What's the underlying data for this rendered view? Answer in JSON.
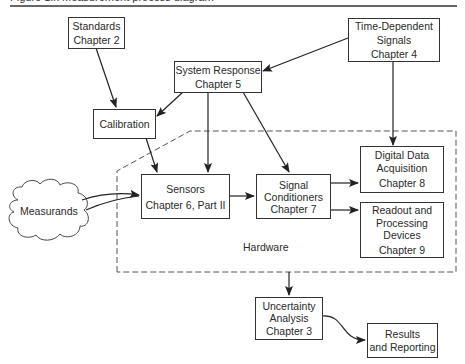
{
  "caption": "Figure 1.x  Measurement process diagram",
  "nodes": {
    "standards": {
      "line1": "Standards",
      "line2": "Chapter 2"
    },
    "time_dependent": {
      "line1": "Time-Dependent",
      "line2": "Signals",
      "line3": "Chapter 4"
    },
    "system_response": {
      "line1": "System Response",
      "line2": "Chapter 5"
    },
    "calibration": {
      "line1": "Calibration"
    },
    "measurands": {
      "line1": "Measurands"
    },
    "sensors": {
      "line1": "Sensors",
      "line2": "Chapter 6, Part II"
    },
    "signal_conditioners": {
      "line1": "Signal",
      "line2": "Conditioners",
      "line3": "Chapter 7"
    },
    "digital_data": {
      "line1": "Digital Data",
      "line2": "Acquisition",
      "line3": "Chapter 8"
    },
    "readout": {
      "line1": "Readout and",
      "line2": "Processing",
      "line3": "Devices",
      "line4": "Chapter 9"
    },
    "uncertainty": {
      "line1": "Uncertainty",
      "line2": "Analysis",
      "line3": "Chapter 3"
    },
    "results": {
      "line1": "Results",
      "line2": "and Reporting"
    }
  },
  "region": {
    "hardware_label": "Hardware"
  },
  "edges": [
    {
      "from": "Standards",
      "to": "Calibration"
    },
    {
      "from": "System Response",
      "to": "Calibration"
    },
    {
      "from": "System Response",
      "to": "Sensors"
    },
    {
      "from": "System Response",
      "to": "Signal Conditioners"
    },
    {
      "from": "Time-Dependent Signals",
      "to": "System Response"
    },
    {
      "from": "Time-Dependent Signals",
      "to": "Digital Data Acquisition"
    },
    {
      "from": "Calibration",
      "to": "Sensors"
    },
    {
      "from": "Measurands",
      "to": "Sensors"
    },
    {
      "from": "Sensors",
      "to": "Signal Conditioners"
    },
    {
      "from": "Signal Conditioners",
      "to": "Digital Data Acquisition"
    },
    {
      "from": "Signal Conditioners",
      "to": "Readout and Processing Devices"
    },
    {
      "from": "Hardware",
      "to": "Uncertainty Analysis"
    },
    {
      "from": "Uncertainty Analysis",
      "to": "Results and Reporting"
    }
  ]
}
